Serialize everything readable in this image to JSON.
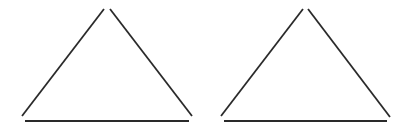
{
  "diagram": {
    "background": "#ffffff",
    "stroke_color": "#2a2a2a",
    "stroke_width": 1.8,
    "shapes": [
      {
        "type": "triangle",
        "label": "left-triangle",
        "edges": [
          {
            "name": "left-edge",
            "x1": 22,
            "y1": 116,
            "x2": 104,
            "y2": 9
          },
          {
            "name": "right-edge",
            "x1": 110,
            "y1": 9,
            "x2": 192,
            "y2": 116
          },
          {
            "name": "base-edge",
            "x1": 25,
            "y1": 121,
            "x2": 189,
            "y2": 121
          }
        ]
      },
      {
        "type": "triangle",
        "label": "right-triangle",
        "edges": [
          {
            "name": "left-edge",
            "x1": 221,
            "y1": 116,
            "x2": 303,
            "y2": 9
          },
          {
            "name": "right-edge",
            "x1": 308,
            "y1": 9,
            "x2": 390,
            "y2": 117
          },
          {
            "name": "base-edge",
            "x1": 224,
            "y1": 121,
            "x2": 387,
            "y2": 121
          }
        ]
      }
    ]
  }
}
